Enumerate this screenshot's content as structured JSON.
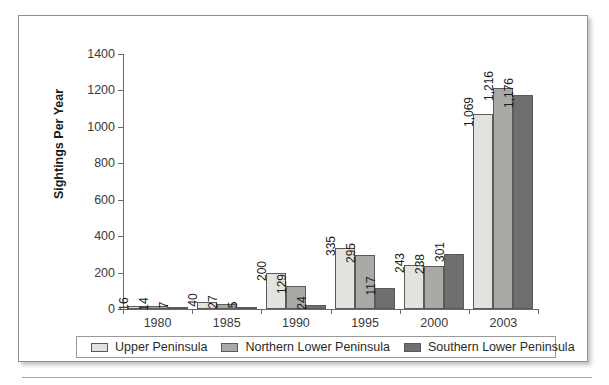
{
  "chart_data": {
    "type": "bar",
    "title": "",
    "subtitle": "",
    "xlabel": "",
    "ylabel": "Sightings Per Year",
    "ylim": [
      0,
      1400
    ],
    "yticks": [
      0,
      200,
      400,
      600,
      800,
      1000,
      1200,
      1400
    ],
    "ytick_labels": [
      "0",
      "200",
      "400",
      "600",
      "800",
      "1000",
      "1200",
      "1400"
    ],
    "grid": false,
    "legend_position": "bottom",
    "categories": [
      "1980",
      "1985",
      "1990",
      "1995",
      "2000",
      "2003"
    ],
    "series": [
      {
        "name": "Upper Peninsula",
        "color": "#e2e2de",
        "values": [
          16,
          40,
          200,
          335,
          243,
          1069
        ],
        "labels": [
          "16",
          "40",
          "200",
          "335",
          "243",
          "1,069"
        ]
      },
      {
        "name": "Northern Lower Peninsula",
        "color": "#a9a9a6",
        "values": [
          14,
          27,
          129,
          295,
          238,
          1216
        ],
        "labels": [
          "14",
          "27",
          "129",
          "295",
          "238",
          "1,216"
        ]
      },
      {
        "name": "Southern Lower Peninsula",
        "color": "#6f6f6f",
        "values": [
          7,
          5,
          24,
          117,
          301,
          1176
        ],
        "labels": [
          "7",
          "5",
          "24",
          "117",
          "301",
          "1,176"
        ]
      }
    ],
    "annotations": []
  },
  "legend": {
    "items": [
      {
        "label": "Upper Peninsula",
        "color": "#e2e2de"
      },
      {
        "label": "Northern Lower Peninsula",
        "color": "#a9a9a6"
      },
      {
        "label": "Southern Lower Peninsula",
        "color": "#6f6f6f"
      }
    ]
  }
}
